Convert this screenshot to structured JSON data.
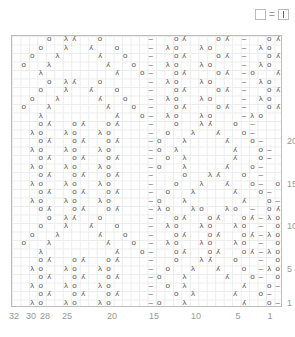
{
  "chart_data": {
    "type": "table",
    "columns": 32,
    "rows": 32,
    "legend": [
      {
        "symbol": "empty box",
        "equals": "|",
        "meaning": "knit"
      }
    ],
    "symbols": {
      "o": "yarn over (O)",
      "l": "ssk (λ)",
      "k": "k2tog (⋌)",
      "-": "purl (–)",
      ".": "knit (empty)"
    },
    "row_labels": [
      1,
      5,
      10,
      15,
      20
    ],
    "col_labels": [
      32,
      30,
      28,
      25,
      20,
      15,
      10,
      5,
      1
    ],
    "grid_top_to_bottom": [
      "....o.lk..o.....-..ok...ok.-..ok",
      "...o..l..k..o...-.lo..lo...-.lo.",
      "..o..l....k..o..-..ok...ok.-..ok",
      ".o..l......k..o.-.lo..lo...-.lo.",
      "...l........k..o-..ok...ok.-o..k",
      "....o.lk..o.....-.lo..lo...-.lo.",
      "...o..l..k..o...-..ok...ok.-..ok",
      "..o..l....k..o..-.lo..lo...-.lo.",
      ".o..l......k..o.-..ok...ok.-..ok",
      "...l........k..o-.lo..lo...-lo..",
      "...ok..ok..ok...-..o..lk..o.-...",
      "..lo..lo..lo....-.o..l..k..o-...",
      "...ok..ok..ok...-o..l....k..o-..",
      "..lo..lo..lo....-o.l......k..o-.",
      "...ok..ok..ok...-.o.l.....k..o-.",
      "..lo..lo..lo....-o..l....k..o-..",
      "...ok..ok..ok...-...o..lk..o.-..",
      "..lo..lo..lo....-..o..l..k..o-.o",
      "...ok..ok..ok...-.o..l....k..o-.",
      "..lo..lo..lo....-o..l......k..o-",
      "...ok..ok..ok...-lo..lo..lo.-.ok",
      "....o.lk..o.....-..ok..ok..ok-lo",
      "...o..l..k..o...-.lo..lo..lo.-.o",
      "..o..l....k..o..-..ok..ok..ok-lo",
      ".o..l......k..o.-.lo..lo..lo.-.o",
      "...l........k..o-..ok..ok..ok-lo",
      "...ok..ok..ok...-..o..lk..o..-.o",
      "..lo..lo..lo....-.o..l..k..o.-lo",
      "...ok..ok..ok...-o..l....k..o-.o",
      "..lo..lo..lo....-.o.l......k..o-",
      "...ok..ok..ok...-..o.l....k..o-.",
      "..lo..lo..lo....-o..l......k..o-"
    ]
  },
  "legend": {
    "equals": "="
  },
  "labels": {
    "rows": [
      {
        "text": "20",
        "row": 20
      },
      {
        "text": "15",
        "row": 15
      },
      {
        "text": "10",
        "row": 10
      },
      {
        "text": "5",
        "row": 5
      },
      {
        "text": "1",
        "row": 1
      }
    ],
    "cols": [
      {
        "text": "32",
        "x": 14
      },
      {
        "text": "30",
        "x": 31
      },
      {
        "text": "28",
        "x": 45
      },
      {
        "text": "25",
        "x": 67
      },
      {
        "text": "20",
        "x": 112
      },
      {
        "text": "15",
        "x": 154
      },
      {
        "text": "10",
        "x": 196
      },
      {
        "text": "5",
        "x": 238
      },
      {
        "text": "1",
        "x": 270
      }
    ]
  }
}
